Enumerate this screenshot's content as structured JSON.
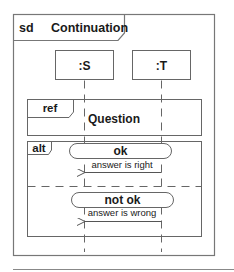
{
  "diagram": {
    "kind_keyword": "sd",
    "title": "Continuation",
    "lifelines": [
      {
        "label": ":S"
      },
      {
        "label": ":T"
      }
    ],
    "ref_fragment": {
      "operator": "ref",
      "name": "Question"
    },
    "alt_fragment": {
      "operator": "alt",
      "operands": [
        {
          "continuation": "ok",
          "message": "answer is right"
        },
        {
          "continuation": "not ok",
          "message": "answer is wrong"
        }
      ]
    }
  },
  "colors": {
    "stroke": "#555555",
    "text": "#1a1a1a",
    "background": "#ffffff"
  }
}
